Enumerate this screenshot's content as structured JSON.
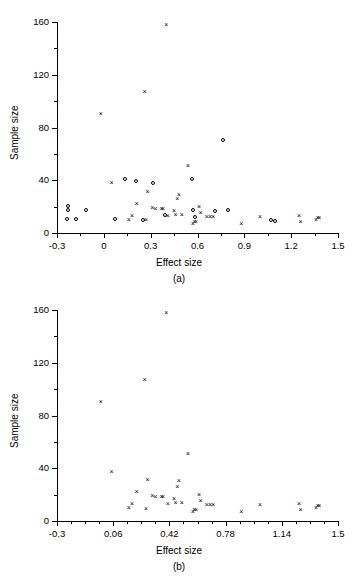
{
  "figure": {
    "panels": [
      {
        "id": "a",
        "caption": "(a)",
        "xlabel": "Effect size",
        "ylabel": "Sample size",
        "xticks": [
          "-0.3",
          "0",
          "0.3",
          "0.6",
          "0.9",
          "1.2",
          "1.5"
        ],
        "yticks": [
          "0",
          "40",
          "80",
          "120",
          "160"
        ]
      },
      {
        "id": "b",
        "caption": "(b)",
        "xlabel": "Effect size",
        "ylabel": "Sample size",
        "xticks": [
          "-0.3",
          "0.06",
          "0.42",
          "0.78",
          "1.14",
          "1.5"
        ],
        "yticks": [
          "0",
          "40",
          "80",
          "120",
          "160"
        ]
      }
    ]
  },
  "chart_data": [
    {
      "type": "scatter",
      "panel": "a",
      "title": "",
      "xlabel": "Effect size",
      "ylabel": "Sample size",
      "xlim": [
        -0.3,
        1.5
      ],
      "ylim": [
        0,
        160
      ],
      "xtick_values": [
        -0.3,
        0,
        0.3,
        0.6,
        0.9,
        1.2,
        1.5
      ],
      "xtick_labels": [
        "-0.3",
        "0",
        "0.3",
        "0.6",
        "0.9",
        "1.2",
        "1.5"
      ],
      "ytick_values": [
        0,
        40,
        80,
        120,
        160
      ],
      "ytick_labels": [
        "0",
        "40",
        "80",
        "120",
        "160"
      ],
      "x_minor_tick_step": 0.15,
      "y_minor_tick_step": 20,
      "grid": false,
      "legend": null,
      "series": [
        {
          "name": "cross-markers",
          "marker": "x",
          "points": [
            [
              -0.02,
              90
            ],
            [
              0.05,
              38
            ],
            [
              0.16,
              10
            ],
            [
              0.18,
              13
            ],
            [
              0.21,
              22
            ],
            [
              0.26,
              107
            ],
            [
              0.27,
              10
            ],
            [
              0.28,
              31
            ],
            [
              0.31,
              19
            ],
            [
              0.33,
              18
            ],
            [
              0.37,
              18
            ],
            [
              0.38,
              18
            ],
            [
              0.4,
              158
            ],
            [
              0.41,
              13
            ],
            [
              0.45,
              17
            ],
            [
              0.46,
              14
            ],
            [
              0.47,
              26
            ],
            [
              0.48,
              29
            ],
            [
              0.5,
              14
            ],
            [
              0.54,
              51
            ],
            [
              0.57,
              7
            ],
            [
              0.58,
              8
            ],
            [
              0.59,
              8
            ],
            [
              0.61,
              20
            ],
            [
              0.62,
              15
            ],
            [
              0.66,
              12
            ],
            [
              0.68,
              12
            ],
            [
              0.7,
              12
            ],
            [
              0.88,
              7
            ],
            [
              1.0,
              12
            ],
            [
              1.25,
              13
            ],
            [
              1.26,
              8
            ],
            [
              1.36,
              10
            ],
            [
              1.37,
              11
            ],
            [
              1.38,
              11
            ]
          ]
        },
        {
          "name": "circle-markers",
          "marker": "o",
          "points": [
            [
              -0.23,
              10
            ],
            [
              -0.22,
              20
            ],
            [
              -0.22,
              17
            ],
            [
              -0.17,
              10
            ],
            [
              -0.11,
              17
            ],
            [
              0.08,
              10
            ],
            [
              0.14,
              40
            ],
            [
              0.21,
              39
            ],
            [
              0.26,
              9
            ],
            [
              0.32,
              37
            ],
            [
              0.4,
              13
            ],
            [
              0.57,
              40
            ],
            [
              0.58,
              17
            ],
            [
              0.59,
              11
            ],
            [
              0.72,
              16
            ],
            [
              0.77,
              70
            ],
            [
              0.8,
              17
            ],
            [
              1.08,
              9
            ],
            [
              1.1,
              8
            ]
          ]
        }
      ]
    },
    {
      "type": "scatter",
      "panel": "b",
      "title": "",
      "xlabel": "Effect size",
      "ylabel": "Sample size",
      "xlim": [
        -0.3,
        1.5
      ],
      "ylim": [
        0,
        160
      ],
      "xtick_values": [
        -0.3,
        0.06,
        0.42,
        0.78,
        1.14,
        1.5
      ],
      "xtick_labels": [
        "-0.3",
        "0.06",
        "0.42",
        "0.78",
        "1.14",
        "1.5"
      ],
      "ytick_values": [
        0,
        40,
        80,
        120,
        160
      ],
      "ytick_labels": [
        "0",
        "40",
        "80",
        "120",
        "160"
      ],
      "x_minor_tick_step": 0.09,
      "y_minor_tick_step": 20,
      "grid": false,
      "legend": null,
      "series": [
        {
          "name": "cross-markers",
          "marker": "x",
          "points": [
            [
              -0.02,
              90
            ],
            [
              0.05,
              37
            ],
            [
              0.16,
              10
            ],
            [
              0.18,
              13
            ],
            [
              0.21,
              22
            ],
            [
              0.26,
              107
            ],
            [
              0.27,
              9
            ],
            [
              0.28,
              31
            ],
            [
              0.31,
              19
            ],
            [
              0.33,
              18
            ],
            [
              0.37,
              18
            ],
            [
              0.38,
              18
            ],
            [
              0.4,
              158
            ],
            [
              0.41,
              13
            ],
            [
              0.45,
              17
            ],
            [
              0.46,
              14
            ],
            [
              0.47,
              26
            ],
            [
              0.48,
              30
            ],
            [
              0.5,
              14
            ],
            [
              0.54,
              51
            ],
            [
              0.57,
              7
            ],
            [
              0.58,
              8
            ],
            [
              0.59,
              8
            ],
            [
              0.61,
              20
            ],
            [
              0.62,
              15
            ],
            [
              0.66,
              12
            ],
            [
              0.68,
              12
            ],
            [
              0.7,
              12
            ],
            [
              0.88,
              7
            ],
            [
              1.0,
              12
            ],
            [
              1.25,
              13
            ],
            [
              1.26,
              8
            ],
            [
              1.36,
              10
            ],
            [
              1.37,
              11
            ],
            [
              1.38,
              11
            ]
          ]
        }
      ]
    }
  ]
}
